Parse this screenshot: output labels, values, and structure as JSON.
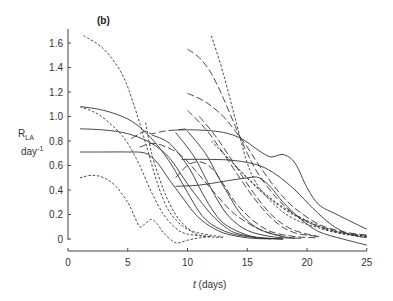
{
  "chart_data": {
    "type": "line",
    "title": "(b)",
    "xlabel": "t (days)",
    "xlabel_italic_part": "t",
    "xlabel_rest": " (days)",
    "ylabel_main": "R",
    "ylabel_sub": "LA",
    "ylabel_unit": "day",
    "ylabel_unit_sup": "-1",
    "xlim": [
      0,
      25
    ],
    "ylim": [
      0,
      1.6
    ],
    "xticks": [
      0,
      5,
      10,
      15,
      20,
      25
    ],
    "xtick_labels": [
      "0",
      "5",
      "10",
      "15",
      "20",
      "25"
    ],
    "yticks": [
      0,
      0.2,
      0.4,
      0.6,
      0.8,
      1.0,
      1.2,
      1.4,
      1.6
    ],
    "ytick_labels": [
      "0",
      "0.2",
      "0.4",
      "0.6",
      "0.8",
      "1.0",
      "1.2",
      "1.4",
      "1.6"
    ],
    "grid": false,
    "legend": "none",
    "line_color": "#333333",
    "series": [
      {
        "name": "solid-1",
        "style": "solid",
        "x": [
          1.1,
          3,
          5,
          6.5,
          8,
          9,
          10,
          11,
          12,
          13.5,
          15,
          17,
          18
        ],
        "y": [
          1.08,
          1.05,
          0.98,
          0.87,
          0.7,
          0.55,
          0.38,
          0.22,
          0.12,
          0.05,
          0.02,
          0.005,
          0
        ]
      },
      {
        "name": "solid-2",
        "style": "solid",
        "x": [
          1,
          3,
          5,
          7,
          8.5,
          10,
          11,
          12,
          13,
          14,
          16,
          18
        ],
        "y": [
          0.9,
          0.89,
          0.86,
          0.78,
          0.66,
          0.45,
          0.32,
          0.2,
          0.11,
          0.05,
          0.01,
          0
        ]
      },
      {
        "name": "solid-3",
        "style": "solid",
        "x": [
          1,
          3,
          5,
          6.5,
          7.5,
          8.5,
          9.5,
          10.5,
          11.5,
          13,
          15,
          17
        ],
        "y": [
          0.71,
          0.71,
          0.71,
          0.7,
          0.62,
          0.48,
          0.35,
          0.22,
          0.13,
          0.05,
          0.01,
          0
        ]
      },
      {
        "name": "solid-4",
        "style": "solid",
        "x": [
          9,
          11,
          13,
          14.5,
          16,
          17,
          18,
          19,
          20,
          21,
          22.5,
          25
        ],
        "y": [
          0.89,
          0.89,
          0.87,
          0.82,
          0.72,
          0.67,
          0.69,
          0.62,
          0.42,
          0.28,
          0.2,
          0.08
        ]
      },
      {
        "name": "solid-5",
        "style": "solid",
        "x": [
          9.5,
          12,
          14,
          16,
          17.5,
          19,
          20.5,
          22,
          23.5,
          25
        ],
        "y": [
          0.65,
          0.65,
          0.64,
          0.6,
          0.52,
          0.4,
          0.25,
          0.12,
          0.04,
          0.01
        ]
      },
      {
        "name": "solid-6",
        "style": "solid",
        "x": [
          9,
          11,
          13,
          15,
          16,
          17,
          18,
          19.5,
          21,
          23,
          25
        ],
        "y": [
          0.43,
          0.44,
          0.47,
          0.5,
          0.5,
          0.42,
          0.3,
          0.16,
          0.06,
          0,
          -0.05
        ]
      },
      {
        "name": "solid-7",
        "style": "solid",
        "x": [
          7,
          8.5,
          10,
          11,
          12,
          13,
          14.5,
          16,
          18
        ],
        "y": [
          0.85,
          0.78,
          0.6,
          0.42,
          0.25,
          0.13,
          0.05,
          0.01,
          0
        ]
      },
      {
        "name": "solid-8",
        "style": "solid",
        "x": [
          9,
          10.5,
          11.5,
          12.5,
          13.5,
          15,
          17,
          19
        ],
        "y": [
          0.87,
          0.68,
          0.5,
          0.32,
          0.18,
          0.07,
          0.02,
          0.005
        ]
      },
      {
        "name": "solid-9",
        "style": "solid",
        "x": [
          10,
          11.5,
          12.5,
          13.5,
          14.5,
          16,
          18,
          19.5
        ],
        "y": [
          0.88,
          0.7,
          0.52,
          0.35,
          0.2,
          0.08,
          0.02,
          0.005
        ]
      },
      {
        "name": "short-dash-1",
        "style": "short-dash",
        "x": [
          1.3,
          3,
          4.5,
          5.5,
          6.5,
          7.5,
          8.5,
          10,
          12,
          13
        ],
        "y": [
          1.66,
          1.55,
          1.35,
          1.1,
          0.78,
          0.45,
          0.22,
          0.08,
          0.03,
          0.02
        ]
      },
      {
        "name": "short-dash-2",
        "style": "short-dash",
        "x": [
          1,
          2.5,
          4,
          5,
          6,
          7,
          8,
          9,
          10,
          12
        ],
        "y": [
          1.08,
          1.02,
          0.9,
          0.78,
          0.6,
          0.38,
          0.2,
          0.09,
          0.04,
          0.02
        ]
      },
      {
        "name": "short-dash-3",
        "style": "short-dash",
        "x": [
          1,
          2,
          3,
          4,
          5,
          5.5,
          6,
          6.5,
          7,
          7.5,
          8,
          9,
          10,
          11,
          12
        ],
        "y": [
          0.5,
          0.52,
          0.5,
          0.43,
          0.3,
          0.2,
          0.1,
          0.13,
          0.16,
          0.12,
          0.05,
          -0.03,
          -0.01,
          0.01,
          0.02
        ]
      },
      {
        "name": "short-dash-4",
        "style": "short-dash",
        "x": [
          12,
          13,
          14,
          15,
          16,
          17.5,
          19,
          21,
          23,
          25
        ],
        "y": [
          1.66,
          1.35,
          0.98,
          0.62,
          0.42,
          0.26,
          0.16,
          0.09,
          0.04,
          0.02
        ]
      },
      {
        "name": "short-dash-5",
        "style": "short-dash",
        "x": [
          6.5,
          7,
          8,
          9,
          10,
          11,
          13
        ],
        "y": [
          0.95,
          0.7,
          0.4,
          0.2,
          0.09,
          0.03,
          0.01
        ]
      },
      {
        "name": "short-dash-6",
        "style": "short-dash",
        "x": [
          12,
          14,
          16,
          18,
          20,
          22,
          24,
          25
        ],
        "y": [
          0.8,
          0.6,
          0.4,
          0.25,
          0.14,
          0.07,
          0.03,
          0.02
        ]
      },
      {
        "name": "short-dash-7",
        "style": "short-dash",
        "x": [
          13,
          15,
          17,
          19,
          21,
          23,
          25
        ],
        "y": [
          0.7,
          0.5,
          0.33,
          0.2,
          0.11,
          0.05,
          0.02
        ]
      },
      {
        "name": "long-dash-1",
        "style": "long-dash",
        "x": [
          10,
          11,
          12,
          13,
          14,
          15,
          16,
          17.5,
          19,
          21,
          23,
          25
        ],
        "y": [
          1.55,
          1.48,
          1.35,
          1.15,
          0.92,
          0.7,
          0.52,
          0.33,
          0.2,
          0.1,
          0.05,
          0.03
        ]
      },
      {
        "name": "long-dash-2",
        "style": "long-dash",
        "x": [
          10,
          11.5,
          13,
          14,
          15,
          16,
          17.5,
          19,
          21,
          23,
          25
        ],
        "y": [
          1.19,
          1.12,
          1.0,
          0.88,
          0.75,
          0.6,
          0.4,
          0.25,
          0.12,
          0.06,
          0.03
        ]
      },
      {
        "name": "long-dash-3",
        "style": "long-dash",
        "x": [
          5.3,
          6,
          6.5,
          7,
          8,
          9,
          10
        ],
        "y": [
          0.82,
          0.86,
          0.88,
          0.86,
          0.88,
          0.89,
          0.9
        ]
      },
      {
        "name": "long-dash-4",
        "style": "long-dash",
        "x": [
          6,
          7,
          8,
          9.5,
          11,
          12.5,
          14,
          16,
          18
        ],
        "y": [
          0.75,
          0.78,
          0.76,
          0.68,
          0.52,
          0.35,
          0.2,
          0.08,
          0.02
        ]
      },
      {
        "name": "long-dash-5",
        "style": "long-dash",
        "x": [
          9,
          10,
          11,
          12,
          13,
          14,
          15.5,
          17,
          19,
          21
        ],
        "y": [
          0.5,
          0.6,
          0.63,
          0.58,
          0.45,
          0.3,
          0.15,
          0.06,
          0.02,
          0.01
        ]
      },
      {
        "name": "long-dash-6",
        "style": "long-dash",
        "x": [
          10,
          11.5,
          13,
          14.5,
          16,
          17.5,
          19,
          21
        ],
        "y": [
          1.05,
          0.9,
          0.7,
          0.48,
          0.28,
          0.13,
          0.05,
          0.02
        ]
      },
      {
        "name": "long-dash-7",
        "style": "long-dash",
        "x": [
          11,
          12.5,
          14,
          15.5,
          17,
          18.5,
          20,
          21
        ],
        "y": [
          1.0,
          0.82,
          0.6,
          0.38,
          0.2,
          0.09,
          0.04,
          0.02
        ]
      }
    ]
  }
}
